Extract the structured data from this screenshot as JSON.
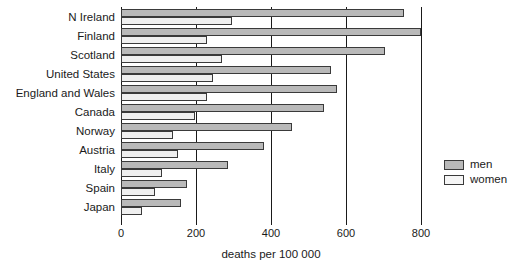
{
  "chart_data": {
    "type": "bar",
    "orientation": "horizontal",
    "title": "",
    "xlabel": "deaths per 100 000",
    "ylabel": "",
    "xlim": [
      0,
      800
    ],
    "xticks": [
      0,
      200,
      400,
      600,
      800
    ],
    "xtick_labels": [
      "0",
      "200",
      "400",
      "600",
      "800"
    ],
    "grid": true,
    "grid_axis": "x",
    "legend_position": "right",
    "categories": [
      "N Ireland",
      "Finland",
      "Scotland",
      "United States",
      "England and Wales",
      "Canada",
      "Norway",
      "Austria",
      "Italy",
      "Spain",
      "Japan"
    ],
    "series": [
      {
        "name": "men",
        "color": "#b9b9b9",
        "values": [
          755,
          800,
          705,
          560,
          575,
          540,
          455,
          380,
          285,
          175,
          160
        ]
      },
      {
        "name": "women",
        "color": "#efefef",
        "values": [
          295,
          230,
          270,
          245,
          228,
          198,
          138,
          153,
          108,
          90,
          55
        ]
      }
    ]
  },
  "legend": {
    "items": [
      {
        "label": "men",
        "swatch": "men"
      },
      {
        "label": "women",
        "swatch": "women"
      }
    ]
  }
}
